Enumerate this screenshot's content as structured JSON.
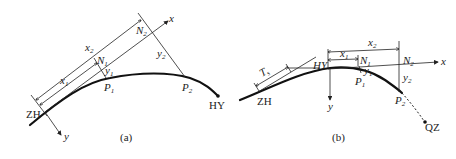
{
  "figure_a": {
    "caption": "(a)",
    "points": {
      "start": "ZH",
      "end": "HY",
      "p1": {
        "base": "P",
        "sub": "1"
      },
      "p2": {
        "base": "P",
        "sub": "2"
      },
      "n1": {
        "base": "N",
        "sub": "1"
      },
      "n2": {
        "base": "N",
        "sub": "2"
      }
    },
    "axes": {
      "x": "x",
      "y": "y"
    },
    "dims": {
      "x1": {
        "base": "x",
        "sub": "1"
      },
      "x2": {
        "base": "x",
        "sub": "2"
      },
      "y1": {
        "base": "y",
        "sub": "1"
      },
      "y2": {
        "base": "y",
        "sub": "2"
      }
    }
  },
  "figure_b": {
    "caption": "(b)",
    "points": {
      "start": "ZH",
      "hy": "HY",
      "end": "QZ",
      "p1": {
        "base": "P",
        "sub": "1"
      },
      "p2": {
        "base": "P",
        "sub": "2"
      },
      "n1": {
        "base": "N",
        "sub": "1"
      },
      "n2": {
        "base": "N",
        "sub": "2"
      }
    },
    "axes": {
      "x": "x",
      "y": "y"
    },
    "dims": {
      "ts": {
        "base": "T",
        "sub": "s"
      },
      "x1": {
        "base": "x",
        "sub": "1"
      },
      "x2": {
        "base": "x",
        "sub": "2"
      },
      "y1": {
        "base": "y",
        "sub": "1"
      },
      "y2": {
        "base": "y",
        "sub": "2"
      }
    }
  }
}
